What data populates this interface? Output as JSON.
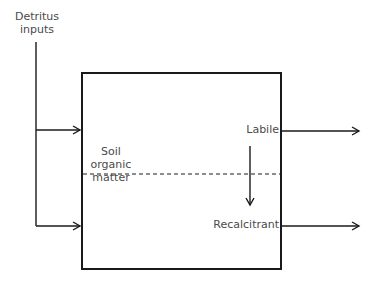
{
  "diagram": {
    "input_label_line1": "Detritus",
    "input_label_line2": "inputs",
    "box_label_line1": "Soil",
    "box_label_line2": "organic",
    "box_label_line3": "matter",
    "pool_top": "Labile",
    "pool_bottom": "Recalcitrant",
    "colors": {
      "stroke": "#1a1a1a",
      "text": "#4a4a4a",
      "background": "#ffffff"
    }
  }
}
